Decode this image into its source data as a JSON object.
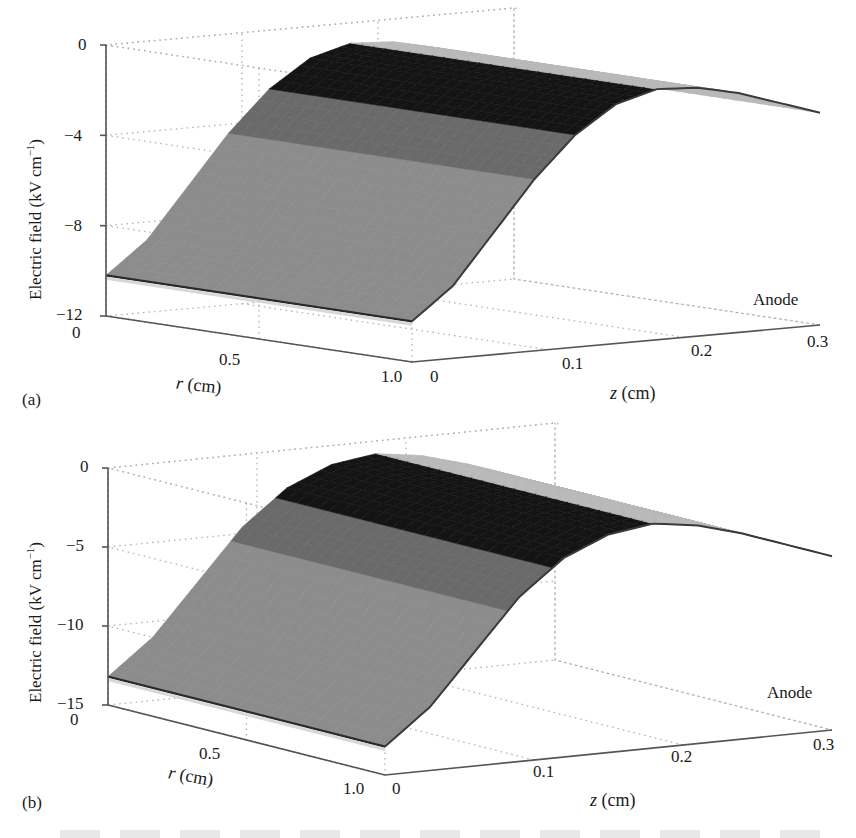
{
  "figure": {
    "panels": [
      {
        "id": "a",
        "label": "(a)"
      },
      {
        "id": "b",
        "label": "(b)"
      }
    ]
  },
  "chart_data": [
    {
      "type": "surface3d",
      "panel": "(a)",
      "title": "",
      "zlabel": "Electric field (kV cm⁻¹)",
      "xlabel": "r (cm)",
      "ylabel": "z (cm)",
      "annotation": "Anode",
      "z_ticks": [
        0,
        -4,
        -8,
        -12
      ],
      "zlim": [
        -12,
        0
      ],
      "r_ticks": [
        0,
        0.5,
        1.0
      ],
      "rlim": [
        0,
        1.0
      ],
      "z_axis_ticks": [
        0,
        0.1,
        0.2,
        0.3
      ],
      "zaxis_lim": [
        0,
        0.3
      ],
      "grid": true,
      "surface_profile_vs_z": {
        "z_cm": [
          0,
          0.03,
          0.06,
          0.09,
          0.12,
          0.15,
          0.18,
          0.21,
          0.24,
          0.27,
          0.3
        ],
        "E_kV_per_cm": [
          -10.2,
          -8.8,
          -6.6,
          -4.4,
          -2.6,
          -1.4,
          -0.9,
          -1.0,
          -1.4,
          -2.0,
          -2.6
        ]
      },
      "r_dependence": "approximately uniform in r from 0 to 1.0 cm"
    },
    {
      "type": "surface3d",
      "panel": "(b)",
      "title": "",
      "zlabel": "Electric field (kV cm⁻¹)",
      "xlabel": "r (cm)",
      "ylabel": "z (cm)",
      "annotation": "Anode",
      "z_ticks": [
        0,
        -5,
        -10,
        -15
      ],
      "zlim": [
        -15,
        0
      ],
      "r_ticks": [
        0,
        0.5,
        1.0
      ],
      "rlim": [
        0,
        1.0
      ],
      "z_axis_ticks": [
        0,
        0.1,
        0.2,
        0.3
      ],
      "zaxis_lim": [
        0,
        0.3
      ],
      "grid": true,
      "surface_profile_vs_z": {
        "z_cm": [
          0,
          0.03,
          0.06,
          0.09,
          0.12,
          0.15,
          0.18,
          0.21,
          0.24,
          0.27,
          0.3
        ],
        "E_kV_per_cm": [
          -13.2,
          -11.0,
          -7.8,
          -4.6,
          -2.4,
          -1.2,
          -0.8,
          -1.2,
          -2.0,
          -3.0,
          -4.0
        ]
      },
      "r_dependence": "approximately uniform in r from 0 to 1.0 cm"
    }
  ],
  "labels": {
    "a": {
      "ylabel": "Electric field (kV cm",
      "ylabel_sup": "−1",
      "ylabel_tail": ")",
      "yticks": [
        "0",
        "−4",
        "−8",
        "−12"
      ],
      "rticks": [
        "0",
        "0.5",
        "1.0"
      ],
      "zticks": [
        "0",
        "0.1",
        "0.2",
        "0.3"
      ],
      "r_var": "r",
      "z_var": "z",
      "unit": "(cm)",
      "anode": "Anode",
      "panel": "(a)"
    },
    "b": {
      "ylabel": "Electric field (kV cm",
      "ylabel_sup": "−1",
      "ylabel_tail": ")",
      "yticks": [
        "0",
        "−5",
        "−10",
        "−15"
      ],
      "rticks": [
        "0",
        "0.5",
        "1.0"
      ],
      "zticks": [
        "0",
        "0.1",
        "0.2",
        "0.3"
      ],
      "r_var": "r",
      "z_var": "z",
      "unit": "(cm)",
      "anode": "Anode",
      "panel": "(b)"
    }
  },
  "colors": {
    "surface_light": "#8c8c8c",
    "surface_mid": "#6a6a6a",
    "surface_dark": "#141414",
    "edge": "#b9b9b9",
    "grid": "#b0b0b0",
    "axis": "#555555"
  }
}
